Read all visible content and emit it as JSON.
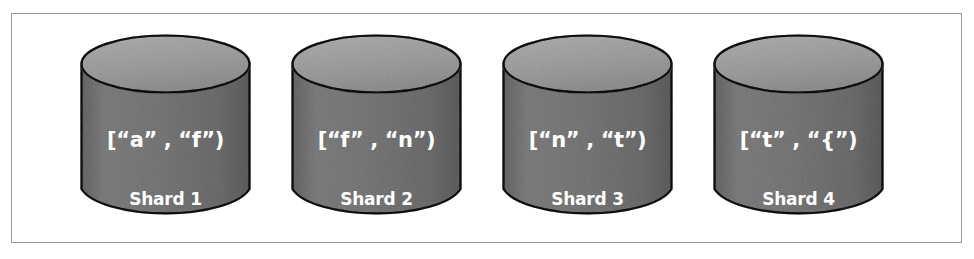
{
  "figure": {
    "type": "sharding-diagram",
    "background_color": "#ffffff",
    "frame_border_color": "#9a9a9a",
    "caption": ""
  },
  "style": {
    "cylinder_top_color": "#c9c9c9",
    "cylinder_body_color": "#a9a9a9",
    "cylinder_outline_color": "#3a3a3a",
    "label_text_color": "#ffffff"
  },
  "shards": [
    {
      "name": "Shard 1",
      "range_label": "[“a” , “f”)",
      "range_start": "a",
      "range_end": "f",
      "interval": "[a, f)",
      "icon": "database-cylinder-icon"
    },
    {
      "name": "Shard 2",
      "range_label": "[“f” , “n”)",
      "range_start": "f",
      "range_end": "n",
      "interval": "[f, n)",
      "icon": "database-cylinder-icon"
    },
    {
      "name": "Shard 3",
      "range_label": "[“n” , “t”)",
      "range_start": "n",
      "range_end": "t",
      "interval": "[n, t)",
      "icon": "database-cylinder-icon"
    },
    {
      "name": "Shard 4",
      "range_label": "[“t” , “{”)",
      "range_start": "t",
      "range_end": "{",
      "interval": "[t, {)",
      "icon": "database-cylinder-icon"
    }
  ]
}
